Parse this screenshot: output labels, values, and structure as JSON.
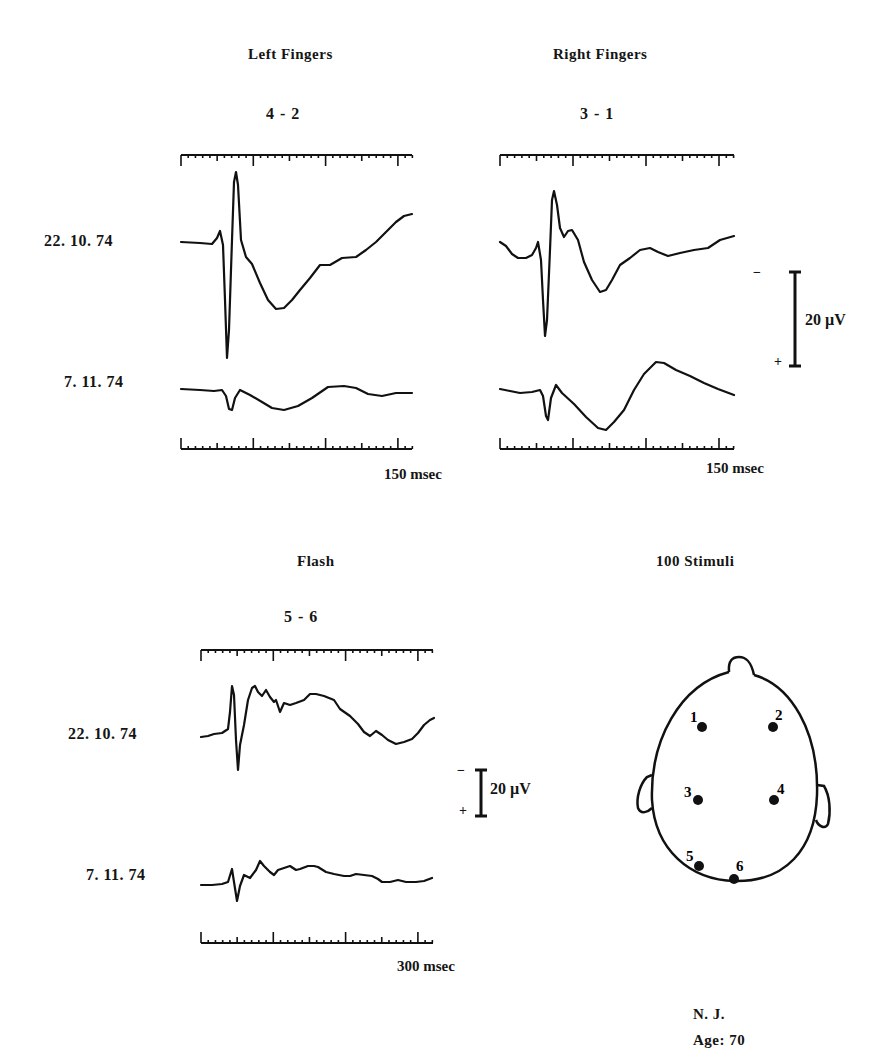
{
  "figure": {
    "panels": [
      {
        "id": "left-fingers",
        "title": "Left Fingers",
        "derivation": "4 - 2",
        "time_label": "150 msec",
        "dates": [
          "22. 10. 74",
          "7. 11. 74"
        ]
      },
      {
        "id": "right-fingers",
        "title": "Right Fingers",
        "derivation": "3 - 1",
        "time_label": "150 msec",
        "dates": []
      },
      {
        "id": "flash",
        "title": "Flash",
        "derivation": "5 - 6",
        "time_label": "300 msec",
        "dates": [
          "22. 10. 74",
          "7. 11. 74"
        ]
      }
    ],
    "calibration": [
      {
        "label": "20 µV",
        "minus": "−",
        "plus": "+"
      },
      {
        "label": "20 µV",
        "minus": "−",
        "plus": "+"
      }
    ],
    "head": {
      "title": "100 Stimuli",
      "electrodes": [
        "1",
        "2",
        "3",
        "4",
        "5",
        "6"
      ]
    },
    "subject": {
      "name": "N. J.",
      "age": "Age: 70"
    }
  },
  "chart_data": [
    {
      "type": "line",
      "title": "Left Fingers — derivation 4 - 2",
      "xlabel": "time (msec)",
      "xlim": [
        0,
        160
      ],
      "x_major_ticks": [
        0,
        50,
        100,
        150
      ],
      "x_minor_tick_step": 5,
      "time_scale_label": "150 msec",
      "amplitude_scale": "20 µV (negative up)",
      "series": [
        {
          "name": "22. 10. 74",
          "points_px": [
            [
              181,
              242
            ],
            [
              200,
              243
            ],
            [
              212,
              244
            ],
            [
              217,
              238
            ],
            [
              220,
              231
            ],
            [
              223,
              245
            ],
            [
              225,
              300
            ],
            [
              227,
              358
            ],
            [
              229,
              330
            ],
            [
              232,
              240
            ],
            [
              234,
              182
            ],
            [
              236,
              172
            ],
            [
              238,
              185
            ],
            [
              241,
              240
            ],
            [
              246,
              257
            ],
            [
              252,
              264
            ],
            [
              260,
              283
            ],
            [
              268,
              300
            ],
            [
              276,
              309
            ],
            [
              284,
              308
            ],
            [
              292,
              300
            ],
            [
              300,
              290
            ],
            [
              310,
              278
            ],
            [
              320,
              265
            ],
            [
              330,
              265
            ],
            [
              342,
              258
            ],
            [
              356,
              257
            ],
            [
              366,
              250
            ],
            [
              376,
              242
            ],
            [
              386,
              232
            ],
            [
              396,
              222
            ],
            [
              404,
              216
            ],
            [
              412,
              214
            ]
          ]
        },
        {
          "name": "7. 11. 74",
          "points_px": [
            [
              181,
              389
            ],
            [
              200,
              390
            ],
            [
              214,
              391
            ],
            [
              222,
              390
            ],
            [
              226,
              396
            ],
            [
              229,
              409
            ],
            [
              232,
              410
            ],
            [
              235,
              398
            ],
            [
              240,
              390
            ],
            [
              250,
              395
            ],
            [
              262,
              402
            ],
            [
              272,
              408
            ],
            [
              284,
              410
            ],
            [
              298,
              406
            ],
            [
              312,
              398
            ],
            [
              328,
              387
            ],
            [
              344,
              386
            ],
            [
              356,
              388
            ],
            [
              368,
              394
            ],
            [
              382,
              396
            ],
            [
              396,
              393
            ],
            [
              412,
              393
            ]
          ]
        }
      ]
    },
    {
      "type": "line",
      "title": "Right Fingers — derivation 3 - 1",
      "xlabel": "time (msec)",
      "xlim": [
        0,
        160
      ],
      "x_major_ticks": [
        0,
        50,
        100,
        150
      ],
      "x_minor_tick_step": 5,
      "time_scale_label": "150 msec",
      "amplitude_scale": "20 µV (negative up)",
      "series": [
        {
          "name": "22. 10. 74",
          "points_px": [
            [
              500,
              242
            ],
            [
              506,
              246
            ],
            [
              512,
              254
            ],
            [
              518,
              258
            ],
            [
              526,
              258
            ],
            [
              532,
              255
            ],
            [
              536,
              248
            ],
            [
              538,
              242
            ],
            [
              541,
              260
            ],
            [
              543,
              300
            ],
            [
              545,
              336
            ],
            [
              547,
              320
            ],
            [
              550,
              250
            ],
            [
              552,
              200
            ],
            [
              554,
              191
            ],
            [
              557,
              205
            ],
            [
              560,
              228
            ],
            [
              564,
              237
            ],
            [
              568,
              231
            ],
            [
              572,
              230
            ],
            [
              578,
              240
            ],
            [
              584,
              262
            ],
            [
              592,
              280
            ],
            [
              600,
              292
            ],
            [
              606,
              290
            ],
            [
              612,
              280
            ],
            [
              620,
              265
            ],
            [
              630,
              258
            ],
            [
              640,
              250
            ],
            [
              650,
              248
            ],
            [
              658,
              252
            ],
            [
              668,
              256
            ],
            [
              680,
              253
            ],
            [
              694,
              250
            ],
            [
              708,
              248
            ],
            [
              720,
              240
            ],
            [
              734,
              236
            ]
          ]
        },
        {
          "name": "7. 11. 74",
          "points_px": [
            [
              500,
              389
            ],
            [
              510,
              391
            ],
            [
              520,
              393
            ],
            [
              532,
              392
            ],
            [
              540,
              390
            ],
            [
              543,
              396
            ],
            [
              546,
              416
            ],
            [
              548,
              420
            ],
            [
              551,
              398
            ],
            [
              556,
              385
            ],
            [
              562,
              393
            ],
            [
              574,
              404
            ],
            [
              586,
              417
            ],
            [
              598,
              428
            ],
            [
              606,
              430
            ],
            [
              614,
              422
            ],
            [
              624,
              410
            ],
            [
              634,
              390
            ],
            [
              644,
              374
            ],
            [
              656,
              362
            ],
            [
              664,
              363
            ],
            [
              676,
              370
            ],
            [
              690,
              376
            ],
            [
              704,
              383
            ],
            [
              718,
              389
            ],
            [
              734,
              395
            ]
          ]
        }
      ]
    },
    {
      "type": "line",
      "title": "Flash — derivation 5 - 6",
      "xlabel": "time (msec)",
      "xlim": [
        0,
        320
      ],
      "x_major_ticks": [
        0,
        100,
        200,
        300
      ],
      "x_minor_tick_step": 10,
      "time_scale_label": "300 msec",
      "amplitude_scale": "20 µV (negative up)",
      "series": [
        {
          "name": "22. 10. 74",
          "points_px": [
            [
              201,
              737
            ],
            [
              208,
              736
            ],
            [
              214,
              734
            ],
            [
              222,
              733
            ],
            [
              228,
              729
            ],
            [
              230,
              712
            ],
            [
              232,
              686
            ],
            [
              234,
              695
            ],
            [
              236,
              740
            ],
            [
              238,
              770
            ],
            [
              240,
              745
            ],
            [
              244,
              725
            ],
            [
              248,
              700
            ],
            [
              252,
              688
            ],
            [
              255,
              686
            ],
            [
              258,
              692
            ],
            [
              262,
              696
            ],
            [
              266,
              690
            ],
            [
              270,
              697
            ],
            [
              274,
              702
            ],
            [
              276,
              700
            ],
            [
              280,
              712
            ],
            [
              284,
              703
            ],
            [
              290,
              705
            ],
            [
              296,
              703
            ],
            [
              304,
              700
            ],
            [
              310,
              694
            ],
            [
              316,
              694
            ],
            [
              324,
              696
            ],
            [
              334,
              700
            ],
            [
              340,
              709
            ],
            [
              350,
              716
            ],
            [
              358,
              724
            ],
            [
              364,
              732
            ],
            [
              370,
              736
            ],
            [
              376,
              731
            ],
            [
              382,
              735
            ],
            [
              388,
              740
            ],
            [
              396,
              744
            ],
            [
              404,
              742
            ],
            [
              412,
              739
            ],
            [
              418,
              733
            ],
            [
              424,
              725
            ],
            [
              430,
              720
            ],
            [
              434,
              718
            ]
          ]
        },
        {
          "name": "7. 11. 74",
          "points_px": [
            [
              201,
              885
            ],
            [
              212,
              885
            ],
            [
              222,
              884
            ],
            [
              228,
              882
            ],
            [
              232,
              869
            ],
            [
              234,
              882
            ],
            [
              237,
              901
            ],
            [
              240,
              886
            ],
            [
              244,
              875
            ],
            [
              250,
              878
            ],
            [
              256,
              870
            ],
            [
              260,
              861
            ],
            [
              264,
              866
            ],
            [
              270,
              872
            ],
            [
              274,
              875
            ],
            [
              278,
              870
            ],
            [
              284,
              868
            ],
            [
              290,
              866
            ],
            [
              296,
              870
            ],
            [
              300,
              869
            ],
            [
              308,
              866
            ],
            [
              314,
              866
            ],
            [
              318,
              867
            ],
            [
              326,
              872
            ],
            [
              334,
              874
            ],
            [
              344,
              876
            ],
            [
              350,
              876
            ],
            [
              356,
              874
            ],
            [
              364,
              875
            ],
            [
              372,
              876
            ],
            [
              378,
              879
            ],
            [
              382,
              882
            ],
            [
              390,
              882
            ],
            [
              398,
              880
            ],
            [
              406,
              882
            ],
            [
              416,
              882
            ],
            [
              424,
              881
            ],
            [
              432,
              878
            ]
          ]
        }
      ]
    }
  ]
}
